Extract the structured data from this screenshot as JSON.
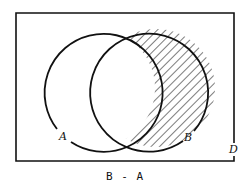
{
  "diagram": {
    "type": "venn",
    "universe_label": "D",
    "sets": [
      {
        "name": "A",
        "label": "A"
      },
      {
        "name": "B",
        "label": "B"
      }
    ],
    "shaded_region": "B - A",
    "caption": "B - A",
    "colors": {
      "stroke": "#111111",
      "hatch": "#222222",
      "background": "#ffffff"
    }
  }
}
